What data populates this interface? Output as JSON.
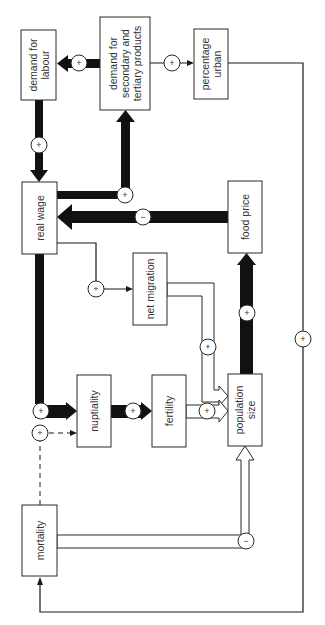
{
  "diagram": {
    "orientation": "rotated 90 degrees counter-clockwise (text reads bottom-to-top)",
    "nodes": {
      "demand_for_labour": {
        "line1": "demand for",
        "line2": "labour"
      },
      "demand_secondary_tertiary": {
        "line1": "demand for",
        "line2": "secondary and",
        "line3": "tertiary products"
      },
      "percentage_urban": {
        "line1": "percentage",
        "line2": "urban"
      },
      "real_wage": {
        "line1": "real wage"
      },
      "food_price": {
        "line1": "food price"
      },
      "net_migration": {
        "line1": "net migration"
      },
      "nuptiality": {
        "line1": "nuptiality"
      },
      "fertility": {
        "line1": "fertility"
      },
      "population_size": {
        "line1": "population",
        "line2": "size"
      },
      "mortality": {
        "line1": "mortality"
      }
    },
    "signs": {
      "plus": "+",
      "minus": "−"
    },
    "edges": [
      {
        "from": "demand for secondary and tertiary products",
        "to": "demand for labour",
        "sign": "+",
        "style": "thick"
      },
      {
        "from": "demand for secondary and tertiary products",
        "to": "percentage urban",
        "sign": "+",
        "style": "thin"
      },
      {
        "from": "demand for labour",
        "to": "real wage",
        "sign": "+",
        "style": "thick"
      },
      {
        "from": "real wage",
        "to": "demand for secondary and tertiary products",
        "sign": "+",
        "style": "thick"
      },
      {
        "from": "food price",
        "to": "real wage",
        "sign": "−",
        "style": "thick"
      },
      {
        "from": "real wage",
        "to": "net migration",
        "sign": "+",
        "style": "thin"
      },
      {
        "from": "real wage",
        "to": "nuptiality",
        "sign": "+",
        "style": "thick"
      },
      {
        "from": "nuptiality",
        "to": "fertility",
        "sign": "+",
        "style": "thick"
      },
      {
        "from": "fertility",
        "to": "population size",
        "sign": "+",
        "style": "hollow"
      },
      {
        "from": "net migration",
        "to": "population size",
        "sign": "+",
        "style": "hollow"
      },
      {
        "from": "population size",
        "to": "food price",
        "sign": "+",
        "style": "thick"
      },
      {
        "from": "mortality",
        "to": "population size",
        "sign": "−",
        "style": "hollow"
      },
      {
        "from": "mortality",
        "to": "nuptiality",
        "sign": "+",
        "style": "dashed"
      },
      {
        "from": "percentage urban",
        "to": "mortality",
        "sign": "+",
        "style": "thin"
      }
    ]
  }
}
